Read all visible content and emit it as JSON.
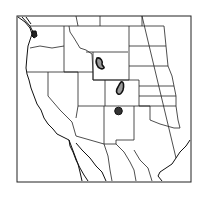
{
  "map": {
    "region": "Western United States and northern Mexico",
    "colors": {
      "background": "#ffffff",
      "lines": "#222222",
      "range_fill_light": "#9a9a9a",
      "range_fill_dark": "#333333"
    },
    "range_areas": [
      {
        "name": "northwest Wyoming area",
        "style": "light-fill outlined"
      },
      {
        "name": "central Colorado area",
        "style": "light-fill outlined"
      },
      {
        "name": "northern New Mexico area",
        "style": "dark-fill"
      },
      {
        "name": "northwest Washington area",
        "style": "dark-fill"
      }
    ]
  }
}
